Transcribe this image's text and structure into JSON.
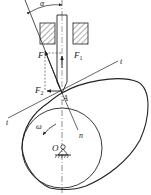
{
  "diagram": {
    "labels": {
      "alpha": "α",
      "F": "F",
      "F1": "F",
      "F1_sub": "1",
      "F2": "F",
      "F2_sub": "2",
      "A": "A",
      "t_left": "t",
      "t_right": "t",
      "n": "n",
      "omega": "ω",
      "O": "O"
    },
    "colors": {
      "stroke": "#222222",
      "background": "#ffffff"
    }
  }
}
